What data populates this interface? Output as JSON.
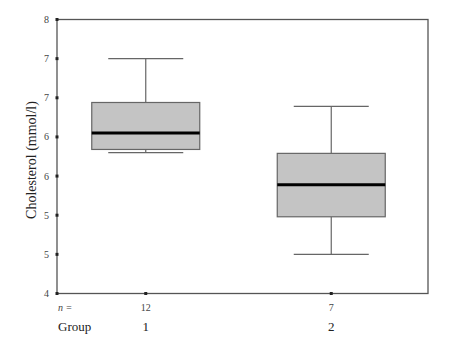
{
  "chart_data": {
    "type": "boxplot",
    "title": "",
    "xlabel": "Group",
    "ylabel": "Cholesterol (mmol/l)",
    "ylim": [
      4.5,
      8.0
    ],
    "yticks": [
      8.0,
      7.5,
      7.0,
      6.5,
      6.0,
      5.5,
      5.0,
      4.5
    ],
    "ytick_labels": [
      "8",
      "7",
      "7",
      "6",
      "6",
      "5",
      "5",
      "4"
    ],
    "n_prefix": "n =",
    "group_prefix": "Group",
    "grid": false,
    "categories": [
      "1",
      "2"
    ],
    "n": [
      "12",
      "7"
    ],
    "boxes": [
      {
        "group": "1",
        "n": 12,
        "whisker_low": 6.3,
        "q1": 6.34,
        "median": 6.55,
        "q3": 6.94,
        "whisker_high": 7.5
      },
      {
        "group": "2",
        "n": 7,
        "whisker_low": 5.0,
        "q1": 5.48,
        "median": 5.89,
        "q3": 6.29,
        "whisker_high": 6.89
      }
    ],
    "colors": {
      "box_fill": "#c4c4c4",
      "box_stroke": "#666666",
      "median": "#000000",
      "axis": "#555555"
    }
  }
}
